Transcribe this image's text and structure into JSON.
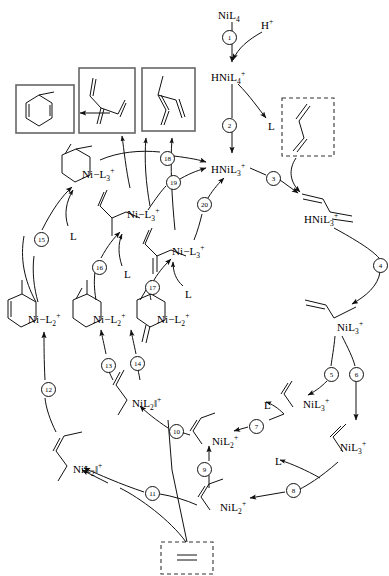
{
  "diagram": {
    "type": "reaction-scheme"
  },
  "species": [
    {
      "id": "nil4",
      "text": "NiL4",
      "html": "NiL<sub>4</sub>",
      "x": 218,
      "y": 10
    },
    {
      "id": "hplus",
      "text": "H+",
      "html": "H<sup>+</sup>",
      "x": 261,
      "y": 18
    },
    {
      "id": "hnil4p",
      "text": "HNiL4+",
      "html": "HNiL<sub>4</sub><sup>+</sup>",
      "x": 211,
      "y": 70
    },
    {
      "id": "l-top",
      "text": "L",
      "html": "L",
      "x": 268,
      "y": 121
    },
    {
      "id": "hnil3p-c",
      "text": "HNiL3+",
      "html": "HNiL<sub>3</sub><sup>+</sup>",
      "x": 211,
      "y": 162
    },
    {
      "id": "hnil3p-r",
      "text": "HNiL3+",
      "html": "HNiL<sub>3</sub><sup>+</sup>",
      "x": 304,
      "y": 212
    },
    {
      "id": "nil3p-r1",
      "text": "NiL3+",
      "html": "NiL<sub>3</sub><sup>+</sup>",
      "x": 337,
      "y": 320
    },
    {
      "id": "nil3p-r2",
      "text": "NiL3+",
      "html": "NiL<sub>3</sub><sup>+</sup>",
      "x": 303,
      "y": 397
    },
    {
      "id": "nil3p-r3",
      "text": "NiL3+",
      "html": "NiL<sub>3</sub><sup>+</sup>",
      "x": 340,
      "y": 440
    },
    {
      "id": "nil2p-b1",
      "text": "NiL2+",
      "html": "NiL<sub>2</sub><sup>+</sup>",
      "x": 212,
      "y": 434
    },
    {
      "id": "nil2p-b2",
      "text": "NiL2+",
      "html": "NiL<sub>2</sub><sup>+</sup>",
      "x": 220,
      "y": 500
    },
    {
      "id": "nil2p-l1",
      "text": "NiL2||+",
      "html": "NiL<sub>2</sub>&#8214;<sup>+</sup>",
      "x": 132,
      "y": 396
    },
    {
      "id": "nil2p-l2",
      "text": "NiL2||+",
      "html": "NiL<sub>2</sub>&#8214;<sup>+</sup>",
      "x": 73,
      "y": 462
    },
    {
      "id": "ni-l2p-1",
      "text": "Ni-L2+",
      "html": "Ni&#8722;L<sub>2</sub><sup>+</sup>",
      "x": 28,
      "y": 312
    },
    {
      "id": "ni-l2p-2",
      "text": "Ni-L2+",
      "html": "Ni&#8722;L<sub>2</sub><sup>+</sup>",
      "x": 93,
      "y": 312
    },
    {
      "id": "ni-l2p-3",
      "text": "Ni-L2+",
      "html": "Ni&#8722;L<sub>2</sub><sup>+</sup>",
      "x": 157,
      "y": 312
    },
    {
      "id": "ni-l3p-1",
      "text": "Ni-L3+",
      "html": "Ni&#8722;L<sub>3</sub><sup>+</sup>",
      "x": 82,
      "y": 167
    },
    {
      "id": "ni-l3p-2",
      "text": "Ni-L3+",
      "html": "Ni&#8722;L<sub>3</sub><sup>+</sup>",
      "x": 127,
      "y": 207
    },
    {
      "id": "ni-l3p-3",
      "text": "Ni-L3+",
      "html": "Ni&#8722;L<sub>3</sub><sup>+</sup>",
      "x": 172,
      "y": 244
    }
  ],
  "ligand_labels": [
    {
      "id": "l-15",
      "text": "L",
      "x": 70,
      "y": 230
    },
    {
      "id": "l-16",
      "text": "L",
      "x": 124,
      "y": 268
    },
    {
      "id": "l-17",
      "text": "L",
      "x": 185,
      "y": 288
    },
    {
      "id": "l-7",
      "text": "L",
      "x": 264,
      "y": 399
    },
    {
      "id": "l-8",
      "text": "L",
      "x": 275,
      "y": 455
    }
  ],
  "steps": [
    {
      "n": "1",
      "x": 228,
      "y": 36
    },
    {
      "n": "2",
      "x": 228,
      "y": 124
    },
    {
      "n": "3",
      "x": 272,
      "y": 177
    },
    {
      "n": "4",
      "x": 379,
      "y": 264
    },
    {
      "n": "5",
      "x": 330,
      "y": 373
    },
    {
      "n": "6",
      "x": 355,
      "y": 373
    },
    {
      "n": "7",
      "x": 255,
      "y": 425
    },
    {
      "n": "8",
      "x": 292,
      "y": 489
    },
    {
      "n": "9",
      "x": 203,
      "y": 468
    },
    {
      "n": "10",
      "x": 175,
      "y": 430
    },
    {
      "n": "11",
      "x": 151,
      "y": 492
    },
    {
      "n": "12",
      "x": 47,
      "y": 388
    },
    {
      "n": "13",
      "x": 107,
      "y": 364
    },
    {
      "n": "14",
      "x": 136,
      "y": 362
    },
    {
      "n": "15",
      "x": 40,
      "y": 238
    },
    {
      "n": "16",
      "x": 98,
      "y": 266
    },
    {
      "n": "17",
      "x": 151,
      "y": 286
    },
    {
      "n": "18",
      "x": 166,
      "y": 157
    },
    {
      "n": "19",
      "x": 172,
      "y": 181
    },
    {
      "n": "20",
      "x": 203,
      "y": 203
    }
  ],
  "product_boxes": [
    {
      "id": "box-cyclohexadiene",
      "style": "solid",
      "structure": "cyclohexadiene",
      "x": 16,
      "y": 85,
      "w": 58,
      "h": 48
    },
    {
      "id": "box-branched-diene",
      "style": "solid",
      "structure": "branched-diene",
      "x": 79,
      "y": 68,
      "w": 56,
      "h": 65
    },
    {
      "id": "box-methyl-diene",
      "style": "solid",
      "structure": "methyl-diene",
      "x": 142,
      "y": 68,
      "w": 53,
      "h": 63
    },
    {
      "id": "box-butadiene",
      "style": "dashed",
      "structure": "butadiene",
      "x": 282,
      "y": 98,
      "w": 52,
      "h": 58
    },
    {
      "id": "box-ethylene",
      "style": "dashed",
      "structure": "ethylene",
      "x": 161,
      "y": 542,
      "w": 52,
      "h": 32
    }
  ],
  "colors": {
    "line": "#1a1a1a",
    "box_solid": "#555555",
    "box_dashed": "#333333",
    "background": "#ffffff"
  }
}
